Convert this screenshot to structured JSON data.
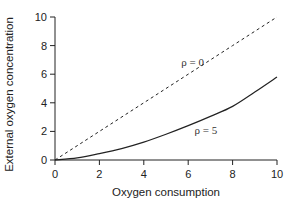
{
  "chart_data": {
    "type": "line",
    "title": "",
    "xlabel": "Oxygen consumption",
    "ylabel": "External oxygen concentration",
    "xlim": [
      0,
      10
    ],
    "ylim": [
      0,
      10
    ],
    "xticks": [
      0,
      2,
      4,
      6,
      8,
      10
    ],
    "yticks": [
      0,
      2,
      4,
      6,
      8,
      10
    ],
    "grid": false,
    "legend": "none (inline curve labels)",
    "series": [
      {
        "name": "ρ = 0",
        "style": "dashed",
        "x": [
          0,
          2,
          4,
          6,
          8,
          10
        ],
        "y": [
          0,
          2,
          4,
          6,
          8,
          10
        ]
      },
      {
        "name": "ρ = 5",
        "style": "solid",
        "x": [
          0,
          1,
          2,
          3,
          4,
          5,
          6,
          7,
          8,
          9,
          10
        ],
        "y": [
          0,
          0.15,
          0.45,
          0.8,
          1.25,
          1.8,
          2.4,
          3.05,
          3.75,
          4.75,
          5.8
        ]
      }
    ],
    "annotations": [
      {
        "text": "ρ = 0",
        "x": 6.2,
        "y": 6.6
      },
      {
        "text": "ρ = 5",
        "x": 6.8,
        "y": 1.8
      }
    ]
  }
}
